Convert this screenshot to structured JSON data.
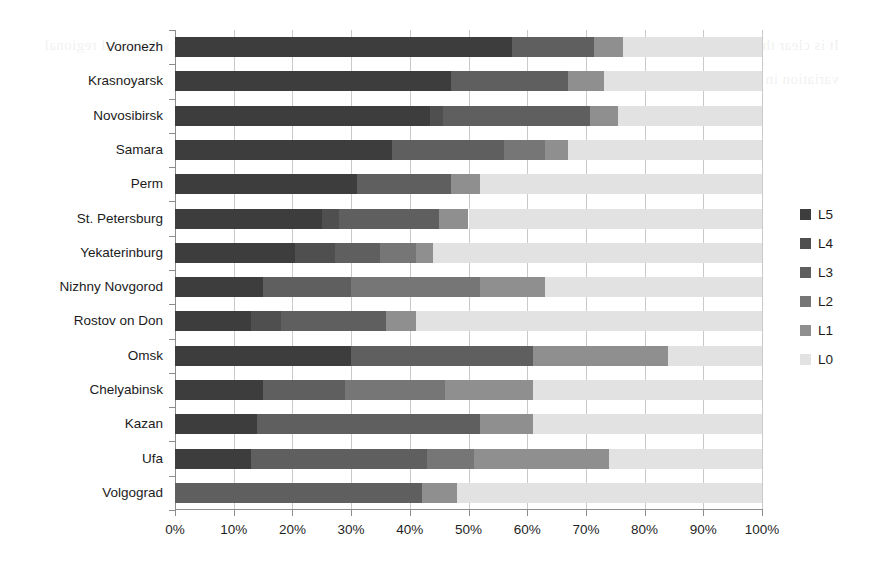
{
  "chart_data": {
    "type": "bar",
    "orientation": "horizontal",
    "stacked": true,
    "normalized": true,
    "title": "",
    "xlabel": "",
    "ylabel": "",
    "xlim": [
      0,
      100
    ],
    "xticks": [
      "0%",
      "10%",
      "20%",
      "30%",
      "40%",
      "50%",
      "60%",
      "70%",
      "80%",
      "90%",
      "100%"
    ],
    "grid": true,
    "legend_position": "right",
    "legend": [
      "L5",
      "L4",
      "L3",
      "L2",
      "L1",
      "L0"
    ],
    "series_colors": {
      "L5": "#3d3d3d",
      "L4": "#4f4f4f",
      "L3": "#5f5f5f",
      "L2": "#767676",
      "L1": "#8f8f8f",
      "L0": "#e2e2e2"
    },
    "categories": [
      "Voronezh",
      "Krasnoyarsk",
      "Novosibirsk",
      "Samara",
      "Perm",
      "St. Petersburg",
      "Yekaterinburg",
      "Nizhny Novgorod",
      "Rostov on Don",
      "Omsk",
      "Chelyabinsk",
      "Kazan",
      "Ufa",
      "Volgograd"
    ],
    "series": [
      {
        "name": "L5",
        "values": [
          57.4,
          47.0,
          43.4,
          37.0,
          31.0,
          25.0,
          20.4,
          15.0,
          13.0,
          30.0,
          15.0,
          14.0,
          13.0,
          0.0
        ]
      },
      {
        "name": "L4",
        "values": [
          0.0,
          0.0,
          2.2,
          0.0,
          0.0,
          3.0,
          6.9,
          0.0,
          5.0,
          0.0,
          0.0,
          0.0,
          0.0,
          0.0
        ]
      },
      {
        "name": "L3",
        "values": [
          14.0,
          20.0,
          25.1,
          19.0,
          16.0,
          17.0,
          7.7,
          15.0,
          18.0,
          31.0,
          14.0,
          38.0,
          30.0,
          42.0
        ]
      },
      {
        "name": "L2",
        "values": [
          0.0,
          0.0,
          0.0,
          7.0,
          0.0,
          0.0,
          6.0,
          22.0,
          0.0,
          0.0,
          17.0,
          0.0,
          8.0,
          0.0
        ]
      },
      {
        "name": "L1",
        "values": [
          5.0,
          6.0,
          4.8,
          4.0,
          5.0,
          5.0,
          3.0,
          11.0,
          5.0,
          23.0,
          15.0,
          9.0,
          23.0,
          6.0
        ]
      },
      {
        "name": "L0",
        "values": [
          23.6,
          27.0,
          24.5,
          33.0,
          48.0,
          50.0,
          56.0,
          37.0,
          59.0,
          16.0,
          39.0,
          39.0,
          26.0,
          52.0
        ]
      }
    ],
    "stacks": [
      {
        "category": "Voronezh",
        "segments": [
          57.4,
          0.0,
          14.0,
          0.0,
          5.0,
          23.6
        ]
      },
      {
        "category": "Krasnoyarsk",
        "segments": [
          47.0,
          0.0,
          20.0,
          0.0,
          6.0,
          27.0
        ]
      },
      {
        "category": "Novosibirsk",
        "segments": [
          43.4,
          2.2,
          25.1,
          0.0,
          4.8,
          24.5
        ]
      },
      {
        "category": "Samara",
        "segments": [
          37.0,
          0.0,
          19.0,
          7.0,
          4.0,
          33.0
        ]
      },
      {
        "category": "Perm",
        "segments": [
          31.0,
          0.0,
          16.0,
          0.0,
          5.0,
          48.0
        ]
      },
      {
        "category": "St. Petersburg",
        "segments": [
          25.0,
          3.0,
          17.0,
          0.0,
          5.0,
          50.0
        ]
      },
      {
        "category": "Yekaterinburg",
        "segments": [
          20.4,
          6.9,
          7.7,
          6.0,
          3.0,
          56.0
        ]
      },
      {
        "category": "Nizhny Novgorod",
        "segments": [
          15.0,
          0.0,
          15.0,
          22.0,
          11.0,
          37.0
        ]
      },
      {
        "category": "Rostov on Don",
        "segments": [
          13.0,
          5.0,
          18.0,
          0.0,
          5.0,
          59.0
        ]
      },
      {
        "category": "Omsk",
        "segments": [
          30.0,
          0.0,
          31.0,
          0.0,
          23.0,
          16.0
        ]
      },
      {
        "category": "Chelyabinsk",
        "segments": [
          15.0,
          0.0,
          14.0,
          17.0,
          15.0,
          39.0
        ]
      },
      {
        "category": "Kazan",
        "segments": [
          14.0,
          0.0,
          38.0,
          0.0,
          9.0,
          39.0
        ]
      },
      {
        "category": "Ufa",
        "segments": [
          13.0,
          0.0,
          30.0,
          8.0,
          23.0,
          26.0
        ]
      },
      {
        "category": "Volgograd",
        "segments": [
          0.0,
          0.0,
          42.0,
          0.0,
          6.0,
          52.0
        ]
      }
    ]
  },
  "ghost_text": "It is clear that the distribution across the surveyed cities remains uneven and the aggregated levels show substantial regional variation in the period under review for the selected sample of respondents reported here"
}
